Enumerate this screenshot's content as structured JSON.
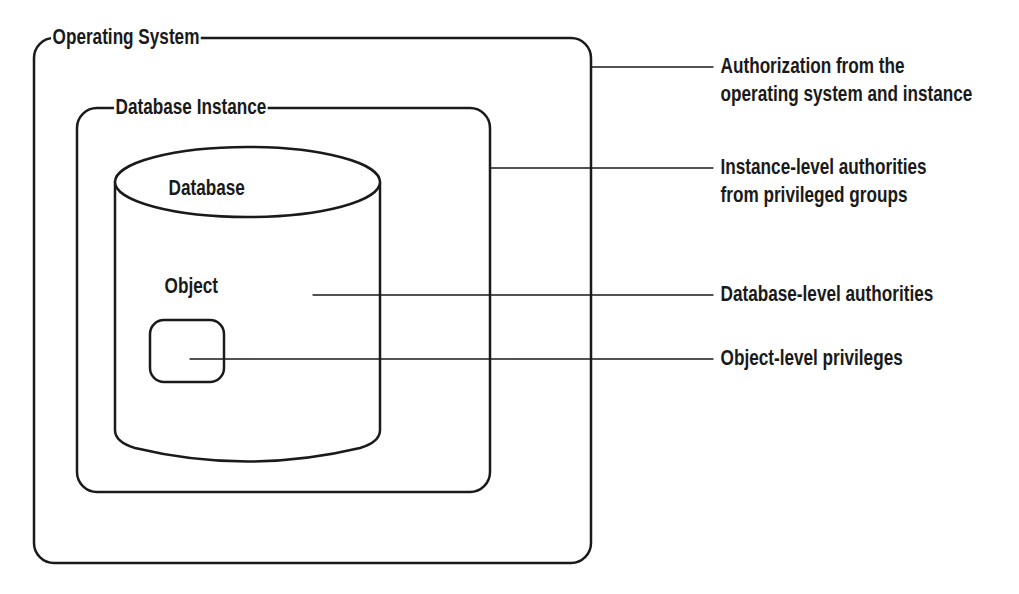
{
  "diagram": {
    "containers": {
      "operating_system": {
        "label": "Operating System"
      },
      "database_instance": {
        "label": "Database Instance"
      },
      "database": {
        "label": "Database"
      },
      "object": {
        "label": "Object"
      }
    },
    "callouts": [
      {
        "id": "os-instance-authorization",
        "lines": [
          "Authorization from the",
          "operating system and instance"
        ]
      },
      {
        "id": "instance-level-authorities",
        "lines": [
          "Instance-level authorities",
          "from privileged groups"
        ]
      },
      {
        "id": "database-level-authorities",
        "lines": [
          "Database-level authorities"
        ]
      },
      {
        "id": "object-level-privileges",
        "lines": [
          "Object-level privileges"
        ]
      }
    ],
    "colors": {
      "stroke": "#1a1a1a",
      "background": "#ffffff"
    }
  }
}
